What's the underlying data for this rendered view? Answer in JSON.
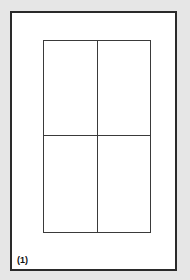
{
  "figure": {
    "label": "(1)",
    "grid": {
      "columns": 2,
      "rows": 2
    },
    "colors": {
      "background": "#e6e6e6",
      "frame_fill": "#ffffff",
      "frame_border": "#2a2a2a",
      "grid_lines": "#3a3a3a",
      "label_text": "#111111"
    }
  }
}
